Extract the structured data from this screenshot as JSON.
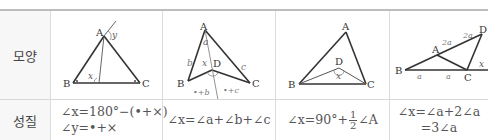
{
  "table": {
    "row_labels": {
      "shape": "모양",
      "property": "성질"
    },
    "columns": [
      {
        "figure": {
          "vertices": {
            "A": "A",
            "B": "B",
            "C": "C"
          },
          "angle_labels": {
            "x": "x",
            "y": "y"
          }
        },
        "property_lines": [
          "∠x=180°−(•+×)",
          "∠y=•+×"
        ]
      },
      {
        "figure": {
          "vertices": {
            "A": "A",
            "B": "B",
            "C": "C",
            "D": "D"
          },
          "angle_labels": {
            "x": "x",
            "a": "a",
            "b": "b",
            "c": "c",
            "pb": "•+b",
            "pc": "•+c"
          }
        },
        "property_lines": [
          "∠x=∠a+∠b+∠c"
        ]
      },
      {
        "figure": {
          "vertices": {
            "A": "A",
            "B": "B",
            "C": "C",
            "D": "D"
          },
          "angle_labels": {
            "x": "x"
          }
        },
        "property": {
          "prefix": "∠x=90°+",
          "frac_num": "1",
          "frac_den": "2",
          "suffix": "∠A"
        }
      },
      {
        "figure": {
          "vertices": {
            "A": "A",
            "B": "B",
            "C": "C",
            "D": "D"
          },
          "angle_labels": {
            "x": "x",
            "a1": "a",
            "a2": "a",
            "twoa1": "2a",
            "twoa2": "2a"
          }
        },
        "property_lines": [
          "∠x=∠a+2∠a",
          "=3∠a"
        ]
      }
    ]
  }
}
